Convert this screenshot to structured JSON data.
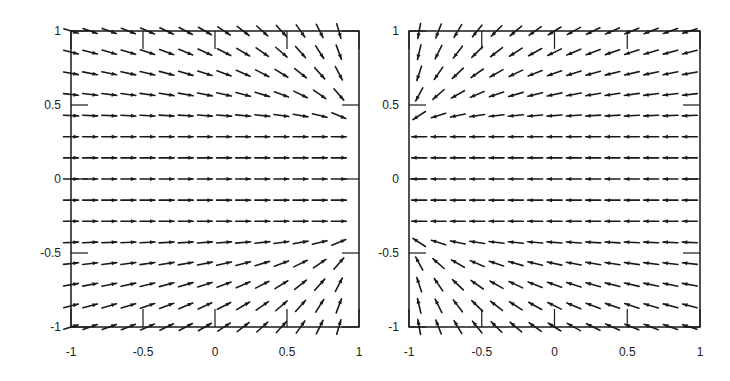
{
  "chart_data": [
    {
      "type": "quiver",
      "title": "",
      "xlabel": "",
      "ylabel": "",
      "xlim": [
        -1,
        1
      ],
      "ylim": [
        -1,
        1
      ],
      "xticks": [
        "-1",
        "-0.5",
        "0",
        "0.5",
        "1"
      ],
      "yticks": [
        "-1",
        "-0.5",
        "0",
        "0.5",
        "1"
      ],
      "grid": false,
      "grid_size": [
        15,
        15
      ],
      "field": "converging toward right edge: horizontal rightward arrows for |y|<0.35, tilting toward sink points near (1, ±0.35)",
      "sink_points": [
        [
          1.05,
          0.35
        ],
        [
          1.05,
          -0.35
        ]
      ],
      "direction": "toward",
      "frame": {
        "left": 71,
        "top": 31,
        "right": 359,
        "bottom": 327
      }
    },
    {
      "type": "quiver",
      "title": "",
      "xlabel": "",
      "ylabel": "",
      "xlim": [
        -1,
        1
      ],
      "ylim": [
        -1,
        1
      ],
      "xticks": [
        "-1",
        "-0.5",
        "0",
        "0.5",
        "1"
      ],
      "yticks": [
        "-1",
        "-0.5",
        "0",
        "0.5",
        "1"
      ],
      "grid": false,
      "grid_size": [
        15,
        15
      ],
      "field": "converging toward left edge: horizontal leftward arrows for |y|<0.35, tilting toward sink points near (-1, ±0.35)",
      "sink_points": [
        [
          -1.05,
          0.35
        ],
        [
          -1.05,
          -0.35
        ]
      ],
      "direction": "toward",
      "frame": {
        "left": 409,
        "top": 31,
        "right": 700,
        "bottom": 327
      }
    }
  ],
  "colors": {
    "ink": "#1a1a1a",
    "background": "#ffffff"
  }
}
